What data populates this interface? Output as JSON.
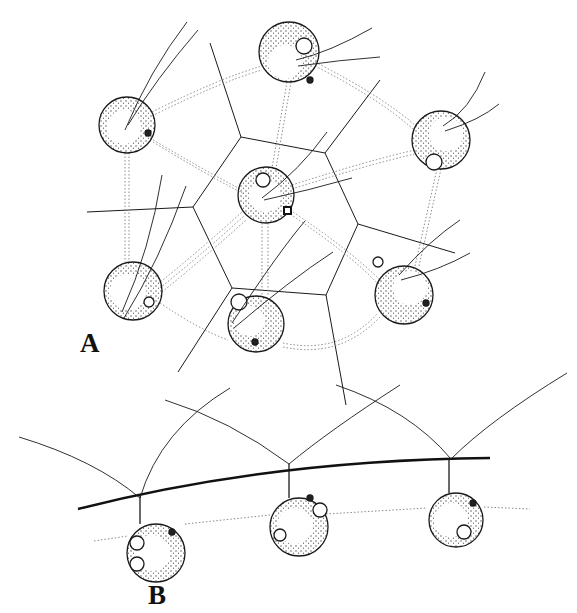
{
  "figure": {
    "panels": [
      {
        "id": "A",
        "label": "A"
      },
      {
        "id": "B",
        "label": "B"
      }
    ],
    "colors": {
      "ink": "#1a1a1a",
      "stipple": "#555555",
      "thread": "#8a8a8a",
      "background": "#ffffff"
    }
  },
  "panel_a": {
    "cells": [
      {
        "cx": 127,
        "cy": 125,
        "r": 28
      },
      {
        "cx": 289,
        "cy": 52,
        "r": 30
      },
      {
        "cx": 441,
        "cy": 140,
        "r": 29
      },
      {
        "cx": 266,
        "cy": 195,
        "r": 28
      },
      {
        "cx": 133,
        "cy": 291,
        "r": 29
      },
      {
        "cx": 256,
        "cy": 324,
        "r": 28
      },
      {
        "cx": 404,
        "cy": 295,
        "r": 29
      }
    ],
    "hexagon": [
      [
        241,
        137
      ],
      [
        325,
        153
      ],
      [
        358,
        224
      ],
      [
        326,
        295
      ],
      [
        232,
        288
      ],
      [
        193,
        207
      ]
    ]
  },
  "panel_b": {
    "cells": [
      {
        "cx": 156,
        "cy": 553,
        "r": 29
      },
      {
        "cx": 299,
        "cy": 527,
        "r": 29
      },
      {
        "cx": 456,
        "cy": 520,
        "r": 27
      }
    ]
  }
}
